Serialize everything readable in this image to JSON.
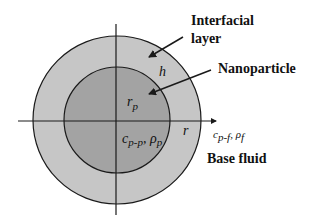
{
  "diagram": {
    "colors": {
      "background": "#ffffff",
      "interfacial_layer": "#c6c6c6",
      "nanoparticle": "#a3a3a3",
      "stroke": "#1a1a1a"
    },
    "labels": {
      "interfacial_layer_line1": "Interfacial",
      "interfacial_layer_line2": "layer",
      "nanoparticle": "Nanoparticle",
      "base_fluid": "Base fluid"
    },
    "symbols": {
      "layer_thickness": "h",
      "particle_radius_base": "r",
      "particle_radius_sub": "p",
      "radial_axis": "r",
      "particle_props": "c",
      "particle_props_sub": "p-p",
      "particle_props_rho": ", ρ",
      "particle_props_rho_sub": "p",
      "fluid_props": "c",
      "fluid_props_sub": "p-f",
      "fluid_props_rho": ", ρ",
      "fluid_props_rho_sub": "f"
    }
  }
}
